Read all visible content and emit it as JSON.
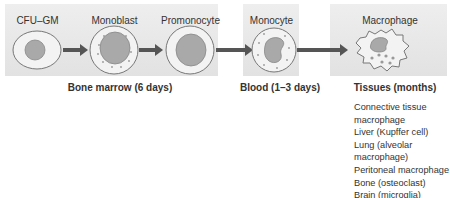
{
  "stages": [
    {
      "label": "CFU–GM",
      "location": "bone-marrow"
    },
    {
      "label": "Monoblast",
      "location": "bone-marrow"
    },
    {
      "label": "Promonocyte",
      "location": "bone-marrow"
    },
    {
      "label": "Monocyte",
      "location": "blood"
    },
    {
      "label": "Macrophage",
      "location": "tissues"
    }
  ],
  "compartments": {
    "bone_marrow": "Bone marrow (6 days)",
    "blood": "Blood (1–3 days)",
    "tissues": "Tissues (months)"
  },
  "tissue_macrophages": [
    "Connective tissue macrophage",
    "Liver (Kupffer cell)",
    "Lung (alveolar macrophage)",
    "Peritoneal macrophage",
    "Bone (osteoclast)",
    "Brain (microglia)",
    "Multinucleate giant cell"
  ],
  "colors": {
    "panel": "#e6e6e6",
    "cell_fill": "#f2f2f2",
    "nucleus": "#a9a9a9",
    "arrow": "#555555",
    "text": "#333333"
  }
}
